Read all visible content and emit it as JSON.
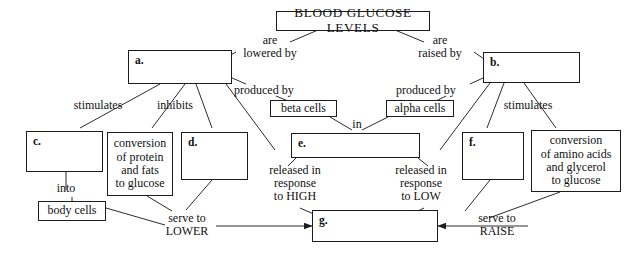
{
  "diagram": {
    "title_box": {
      "label": "BLOOD  GLUCOSE  LEVELS"
    },
    "boxes": [
      {
        "id": "a",
        "label": "a."
      },
      {
        "id": "b",
        "label": "b."
      },
      {
        "id": "c",
        "label": "c."
      },
      {
        "id": "d",
        "label": "d."
      },
      {
        "id": "e",
        "label": "e."
      },
      {
        "id": "f",
        "label": "f."
      },
      {
        "id": "g",
        "label": "g."
      },
      {
        "id": "beta_cells",
        "label": "beta cells"
      },
      {
        "id": "alpha_cells",
        "label": "alpha cells"
      },
      {
        "id": "body_cells",
        "label": "body cells"
      },
      {
        "id": "conversion_left",
        "label": "conversion\nof protein\nand fats\nto glucose"
      },
      {
        "id": "conversion_right",
        "label": "conversion\nof amino acids\nand glycerol\nto glucose"
      }
    ],
    "edge_labels": [
      {
        "id": "are_lowered_by",
        "text": "are\nlowered by"
      },
      {
        "id": "are_raised_by",
        "text": "are\nraised by"
      },
      {
        "id": "produced_by_left",
        "text": "produced by"
      },
      {
        "id": "produced_by_right",
        "text": "produced by"
      },
      {
        "id": "stimulates_left",
        "text": "stimulates"
      },
      {
        "id": "stimulates_right",
        "text": "stimulates"
      },
      {
        "id": "inhibits",
        "text": "inhibits"
      },
      {
        "id": "in",
        "text": "in"
      },
      {
        "id": "into",
        "text": "into"
      },
      {
        "id": "released_high",
        "text": "released in\nresponse\nto HIGH"
      },
      {
        "id": "released_low",
        "text": "released in\nresponse\nto LOW"
      },
      {
        "id": "serve_to_lower",
        "text": "serve to\nLOWER"
      },
      {
        "id": "serve_to_raise",
        "text": "serve to\nRAISE"
      }
    ],
    "colors": {
      "stroke": "#1c1c1c",
      "text": "#111111",
      "background": "#ffffff"
    }
  }
}
